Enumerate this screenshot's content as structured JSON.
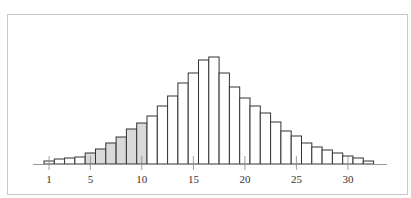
{
  "chart_data": {
    "type": "bar",
    "title": "",
    "xlabel": "",
    "ylabel": "",
    "categories": [
      1,
      2,
      3,
      4,
      5,
      6,
      7,
      8,
      9,
      10,
      11,
      12,
      13,
      14,
      15,
      16,
      17,
      18,
      19,
      20,
      21,
      22,
      23,
      24,
      25,
      26,
      27,
      28,
      29,
      30,
      31,
      32
    ],
    "values": [
      3,
      5,
      6,
      7,
      11,
      15,
      21,
      27,
      35,
      41,
      48,
      58,
      68,
      81,
      91,
      104,
      107,
      91,
      77,
      66,
      58,
      51,
      42,
      33,
      28,
      21,
      17,
      14,
      11,
      8,
      6,
      3
    ],
    "highlighted_range": [
      5,
      10
    ],
    "x_ticks": [
      1,
      5,
      10,
      15,
      20,
      25,
      30
    ],
    "colors": {
      "bar_fill": "#ffffff",
      "highlight_fill": "#d9d9d9",
      "bar_stroke": "#333333",
      "axis": "#999999",
      "frame": "#c8c8c8"
    },
    "grid": false,
    "legend": null,
    "units": "relative height (px)"
  },
  "tick_labels": [
    "1",
    "5",
    "10",
    "15",
    "20",
    "25",
    "30"
  ]
}
